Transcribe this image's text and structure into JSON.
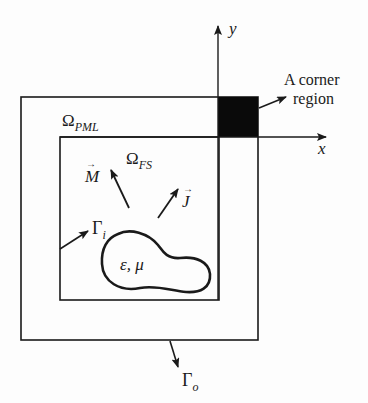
{
  "diagram": {
    "axes": {
      "x_label": "x",
      "y_label": "y"
    },
    "regions": {
      "pml": {
        "symbol": "Ω",
        "subscript": "PML"
      },
      "fs": {
        "symbol": "Ω",
        "subscript": "FS"
      }
    },
    "corner": {
      "line1": "A corner",
      "line2": "region"
    },
    "sources": {
      "magnetic": "M",
      "electric": "J"
    },
    "boundaries": {
      "inner": {
        "symbol": "Γ",
        "subscript": "i"
      },
      "outer": {
        "symbol": "Γ",
        "subscript": "o"
      }
    },
    "scatterer": {
      "label": "ε, μ"
    },
    "colors": {
      "line": "#1a1a1a",
      "corner_fill": "#0a0a0a",
      "background": "#fdfdfd"
    }
  }
}
